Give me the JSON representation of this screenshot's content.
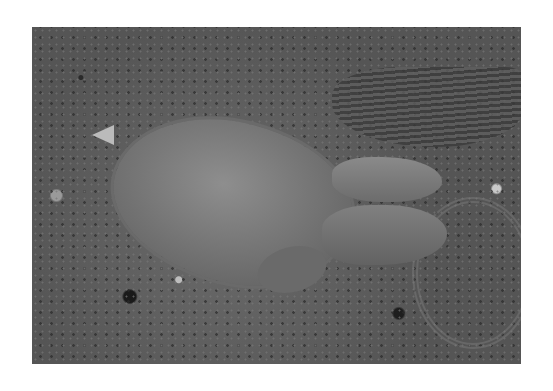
{
  "image": {
    "subject": "sea turtle resting on pebbly shallow shore",
    "style": "grayscale photograph",
    "background": "#ffffff"
  }
}
